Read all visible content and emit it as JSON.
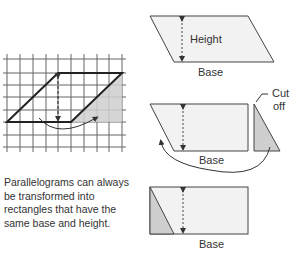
{
  "labels": {
    "height": "Height",
    "base_top": "Base",
    "base_middle": "Base",
    "base_bottom": "Base",
    "cut_off_line1": "Cut",
    "cut_off_line2": "off"
  },
  "caption": {
    "line1": "Parallelograms can always",
    "line2": "be transformed into",
    "line3": "rectangles that have the",
    "line4": "same base and height."
  },
  "colors": {
    "shape_fill": "#f2f2f2",
    "shaded_fill": "#cfcfcf",
    "grid": "#555555",
    "outline": "#333333"
  }
}
